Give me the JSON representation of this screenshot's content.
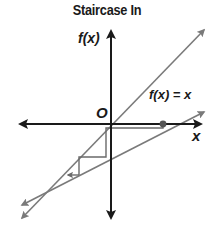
{
  "title": "Staircase In",
  "labels": {
    "y_axis": "f(x)",
    "x_axis": "x",
    "origin": "O",
    "identity_line": "f(x) = x"
  },
  "colors": {
    "axes": "#1a1a1a",
    "lines": "#7a7a7a",
    "staircase": "#6a6a6a",
    "fixed_point": "#555555"
  },
  "diagram": {
    "type": "cobweb-staircase",
    "elements": [
      {
        "name": "x-axis",
        "style": "double-arrow"
      },
      {
        "name": "y-axis",
        "style": "double-arrow"
      },
      {
        "name": "identity-line",
        "label": "f(x) = x",
        "style": "double-arrow"
      },
      {
        "name": "function-line",
        "style": "double-arrow",
        "slope": "less than 1"
      },
      {
        "name": "staircase-path",
        "direction": "converging inward toward intersection"
      },
      {
        "name": "starting-point",
        "marker": "dot on x-axis"
      }
    ]
  }
}
